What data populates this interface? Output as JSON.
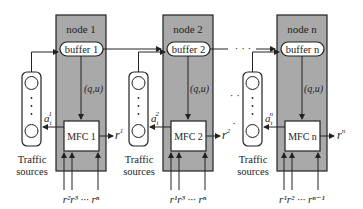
{
  "diagram": {
    "colors": {
      "node_fill": "#a9a9a9",
      "stroke": "#222222",
      "background": "#ffffff",
      "box_fill": "#ffffff"
    },
    "nodes": [
      {
        "title": "node 1",
        "buffer": "buffer 1",
        "qu_label": "(q,u)",
        "mfc": "MFC 1",
        "output": "r",
        "output_sup": "1",
        "arrival": "a",
        "arrival_sub": "t",
        "arrival_sup": "1",
        "inputs": "r²r³ ··· rⁿ"
      },
      {
        "title": "node 2",
        "buffer": "buffer 2",
        "qu_label": "(q,u)",
        "mfc": "MFC 2",
        "output": "r",
        "output_sup": "2",
        "arrival": "a",
        "arrival_sub": "t",
        "arrival_sup": "2",
        "inputs": "r¹r³ ··· rⁿ"
      },
      {
        "title": "node n",
        "buffer": "buffer n",
        "qu_label": "(q,u)",
        "mfc": "MFC n",
        "output": "r",
        "output_sup": "n",
        "arrival": "a",
        "arrival_sub": "t",
        "arrival_sup": "n",
        "inputs": "r¹r² ··· rⁿ⁻¹"
      }
    ],
    "traffic_label_line1": "Traffic",
    "traffic_label_line2": "sources",
    "prev_output_labels": [
      "r",
      "r"
    ],
    "prev_output_sups": [
      "1",
      "2"
    ],
    "ellipsis": "· · ·"
  }
}
